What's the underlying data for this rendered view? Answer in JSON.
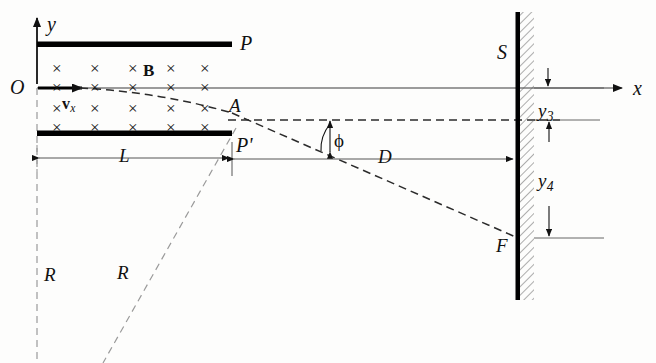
{
  "figure": {
    "kind": "physics-diagram",
    "axes": {
      "x_label": "x",
      "y_label": "y",
      "origin_label": "O"
    },
    "labels": {
      "plate_top": "P",
      "plate_bottom": "P'",
      "field": "B",
      "velocity": "v",
      "velocity_sub": "x",
      "exit_point": "A",
      "screen": "S",
      "hit_point": "F",
      "angle": "ϕ",
      "length_L": "L",
      "length_D": "D",
      "radius_1": "R",
      "radius_2": "R",
      "y3": "y",
      "y3_sub": "3",
      "y4": "y",
      "y4_sub": "4"
    },
    "field_marker": "×",
    "field_marker_name": "cross-x-into-page",
    "field_grid": {
      "columns": [
        58,
        96,
        134,
        172,
        210
      ],
      "rows_upper": [
        68,
        87
      ],
      "rows_lower": [
        108,
        127
      ]
    },
    "colors": {
      "ink": "#111111",
      "line": "#3a3a3a",
      "dash_dark": "#2b2b2b",
      "dash_light": "#9a9a9a",
      "plate": "#000000",
      "screen": "#000000",
      "hatch": "#555555",
      "paper": "#fdfdfc"
    },
    "geometry": {
      "axis_y_x": 37,
      "axis_x_y": 88,
      "plate_left": 37,
      "plate_right": 232,
      "plate_top_y": 44,
      "plate_bottom_y": 133,
      "screen_x": 518,
      "screen_top": 12,
      "screen_bottom": 300,
      "point_A": [
        232,
        113
      ],
      "point_F": [
        518,
        238
      ],
      "dash_horizontal_y": 120,
      "dim_line_y": 158,
      "x_arrow_end": 628
    }
  }
}
